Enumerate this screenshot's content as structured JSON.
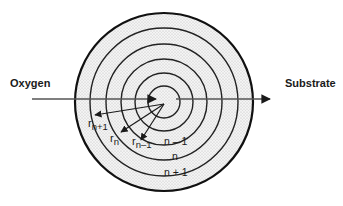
{
  "diagram": {
    "type": "concentric-shell-model",
    "left_label": "Oxygen",
    "right_label": "Substrate",
    "radius_labels": {
      "r_n_plus_1": {
        "base": "r",
        "sub": "n+1"
      },
      "r_n": {
        "base": "r",
        "sub": "n"
      },
      "r_n_minus_1": {
        "base": "r",
        "sub": "n–1"
      }
    },
    "shell_labels": {
      "n_minus_1": "n – 1",
      "n": "n",
      "n_plus_1": "n + 1"
    },
    "colors": {
      "stroke": "#1a1a1a",
      "axis": "#555555",
      "fill_dots": "#b8b8b8"
    }
  }
}
